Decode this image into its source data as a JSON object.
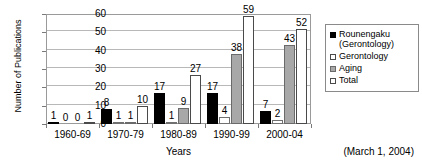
{
  "chart_data": {
    "type": "bar",
    "title": "",
    "xlabel": "Years",
    "ylabel": "Number of Publications",
    "categories": [
      "1960-69",
      "1970-79",
      "1980-89",
      "1990-99",
      "2000-04"
    ],
    "series": [
      {
        "name": "Rounengaku\n(Gerontology)",
        "color": "#000000",
        "values": [
          1,
          8,
          17,
          17,
          7
        ]
      },
      {
        "name": "Gerontology",
        "color": "#ffffff",
        "values": [
          0,
          1,
          1,
          4,
          2
        ]
      },
      {
        "name": "Aging",
        "color": "#a8a8a8",
        "values": [
          0,
          1,
          9,
          38,
          43
        ]
      },
      {
        "name": "Total",
        "color": "#ffffff",
        "values": [
          1,
          10,
          27,
          59,
          52
        ]
      }
    ],
    "ylim": [
      0,
      60
    ],
    "yticks": [
      0,
      10,
      20,
      30,
      40,
      50,
      60
    ],
    "grid": true,
    "legend_position": "right",
    "annotation": "(March 1, 2004)"
  },
  "legend": {
    "items": [
      {
        "label": "Rounengaku\n(Gerontology)"
      },
      {
        "label": "Gerontology"
      },
      {
        "label": "Aging"
      },
      {
        "label": "Total"
      }
    ]
  },
  "footnote": "(March 1, 2004)"
}
